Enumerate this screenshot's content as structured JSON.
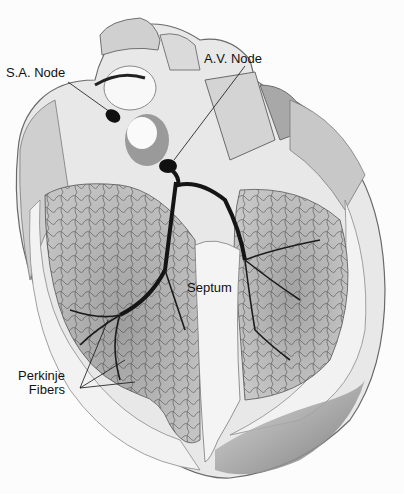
{
  "diagram": {
    "labels": {
      "sa_node": "S.A. Node",
      "av_node": "A.V. Node",
      "septum": "Septum",
      "perkinje_line1": "Perkinje",
      "perkinje_line2": "Fibers"
    },
    "colors": {
      "background": "#fcfcfc",
      "tissue_light": "#e6e6e6",
      "tissue_mid": "#b8b8b8",
      "tissue_dark": "#8a8a8a",
      "conduction": "#1a1a1a"
    }
  }
}
